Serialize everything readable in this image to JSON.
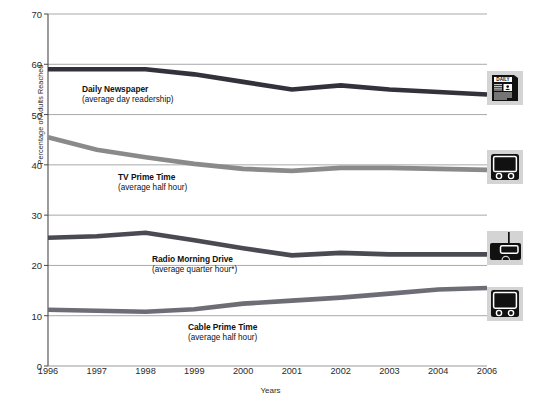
{
  "chart_data": {
    "type": "line",
    "title": "",
    "xlabel": "Years",
    "ylabel": "Percentage of Adults Reached",
    "categories": [
      "1996",
      "1997",
      "1998",
      "1999",
      "2000",
      "2001",
      "2002",
      "2003",
      "2004",
      "2006"
    ],
    "x": [
      1996,
      1997,
      1998,
      1999,
      2000,
      2001,
      2002,
      2003,
      2004,
      2006
    ],
    "ylim": [
      0,
      70
    ],
    "yticks": [
      0,
      10,
      20,
      30,
      40,
      50,
      60,
      70
    ],
    "grid": true,
    "legend_position": "inline-annotations",
    "footnote_marker": "*",
    "series": [
      {
        "name": "Daily Newspaper",
        "sublabel": "(average day readership)",
        "color": "#33323a",
        "icon": "newspaper-icon",
        "values": [
          59.0,
          59.0,
          59.0,
          58.0,
          56.5,
          55.0,
          55.8,
          55.0,
          54.5,
          54.0
        ]
      },
      {
        "name": "TV Prime Time",
        "sublabel": "(average half hour)",
        "color": "#8a8a8a",
        "icon": "television-icon",
        "values": [
          45.5,
          43.0,
          41.5,
          40.2,
          39.2,
          38.8,
          39.4,
          39.4,
          39.2,
          39.0
        ]
      },
      {
        "name": "Radio Morning Drive",
        "sublabel": "(average quarter hour*)",
        "color": "#4a4a52",
        "icon": "radio-icon",
        "values": [
          25.5,
          25.8,
          26.5,
          25.0,
          23.4,
          22.0,
          22.5,
          22.2,
          22.2,
          22.2
        ]
      },
      {
        "name": "Cable Prime Time",
        "sublabel": "(average half hour)",
        "color": "#6d6d75",
        "icon": "cable-television-icon",
        "values": [
          11.2,
          11.0,
          10.8,
          11.3,
          12.4,
          13.0,
          13.6,
          14.4,
          15.2,
          15.5
        ]
      }
    ]
  },
  "axis": {
    "y_title": "Percentage of Adults Reached",
    "x_title": "Years",
    "y_ticks": [
      "0",
      "10",
      "20",
      "30",
      "40",
      "50",
      "60",
      "70"
    ],
    "x_ticks": [
      "1996",
      "1997",
      "1998",
      "1999",
      "2000",
      "2001",
      "2002",
      "2003",
      "2004",
      "2006"
    ]
  },
  "annotations": [
    {
      "name": "Daily Newspaper",
      "sub": "(average day readership)"
    },
    {
      "name": "TV Prime Time",
      "sub": "(average half hour)"
    },
    {
      "name": "Radio Morning Drive",
      "sub": "(average quarter hour*)"
    },
    {
      "name": "Cable Prime Time",
      "sub": "(average half hour)"
    }
  ],
  "icons": {
    "newspaper": {
      "name": "newspaper-icon",
      "masthead": "DAILY"
    },
    "television": {
      "name": "television-icon"
    },
    "radio": {
      "name": "radio-icon"
    },
    "cable_television": {
      "name": "cable-television-icon"
    }
  },
  "colors": {
    "grid": "#9a9a9a",
    "axis": "#4a4a4a",
    "plot_background": "#ffffff",
    "icon_panel": "#d4d4d4",
    "series_newspaper": "#33323a",
    "series_tv": "#8a8a8a",
    "series_radio": "#4a4a52",
    "series_cable": "#6d6d75"
  }
}
